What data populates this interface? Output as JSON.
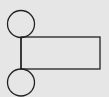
{
  "diagram": {
    "background": "#e6e6e6",
    "stroke": "#222222",
    "top_circle": {
      "cx": 21,
      "cy": 24,
      "r": 13.5
    },
    "bottom_circle": {
      "cx": 21,
      "cy": 82.5,
      "r": 13.5
    },
    "rectangle": {
      "x": 21,
      "y": 37,
      "width": 79,
      "height": 32
    },
    "connector": {
      "x": 21,
      "y1": 37.5,
      "y2": 69
    }
  }
}
